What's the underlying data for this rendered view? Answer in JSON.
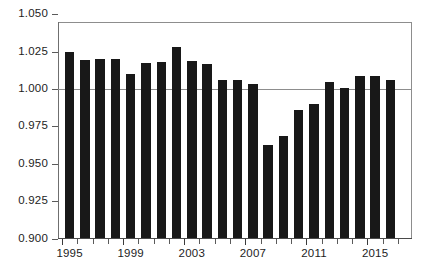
{
  "chart_data": {
    "type": "bar",
    "title": "",
    "subtitle": "",
    "xlabel": "",
    "ylabel": "",
    "categories": [
      "1995",
      "1996",
      "1997",
      "1998",
      "1999",
      "2000",
      "2001",
      "2002",
      "2003",
      "2004",
      "2005",
      "2006",
      "2007",
      "2008",
      "2009",
      "2010",
      "2011",
      "2012",
      "2013",
      "2014",
      "2015",
      "2016"
    ],
    "values": [
      1.0245,
      1.0197,
      1.02,
      1.02,
      1.0103,
      1.0177,
      1.018,
      1.0278,
      1.019,
      1.0165,
      1.006,
      1.006,
      1.0035,
      0.9625,
      0.9685,
      0.986,
      0.99,
      1.005,
      1.0005,
      1.009,
      1.009,
      1.006
    ],
    "ylim": [
      0.9,
      1.05
    ],
    "xlim_labels": [
      "1995",
      "2016"
    ],
    "ytick_labels": [
      "1.050",
      "1.025",
      "1.000",
      "0.975",
      "0.950",
      "0.925",
      "0.900"
    ],
    "ytick_values": [
      1.05,
      1.025,
      1.0,
      0.975,
      0.95,
      0.925,
      0.9
    ],
    "xtick_labels": [
      "1995",
      "1999",
      "2003",
      "2007",
      "2011",
      "2015"
    ],
    "xtick_values": [
      1995,
      1999,
      2003,
      2007,
      2011,
      2015
    ],
    "gridlines": [
      1.0
    ],
    "grid": "horizontal-single",
    "legend": null,
    "legend_position": "none",
    "bar_color": "#181818",
    "axis_color": "#8d8d8d",
    "background_color": "#ffffff",
    "baseline": 0.9,
    "annotations": []
  },
  "colors": {
    "bar": "#181818",
    "axis": "#8d8d8d",
    "text": "#1d1d1d",
    "background": "#ffffff"
  }
}
